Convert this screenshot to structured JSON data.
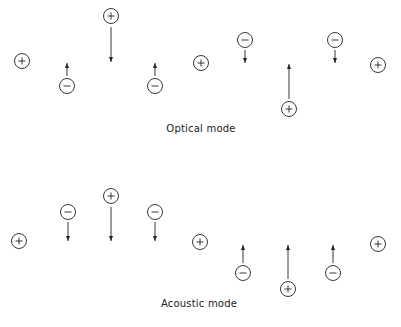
{
  "colors": {
    "ink": "#222222",
    "background": "#ffffff"
  },
  "ion_radius": 7.5,
  "panels": [
    {
      "id": "optical",
      "label": "Optical mode",
      "label_pos": {
        "x": 201,
        "y": 129
      },
      "ions": [
        {
          "charge": "+",
          "x": 22,
          "y": 61
        },
        {
          "charge": "-",
          "x": 67,
          "y": 86,
          "arrow": {
            "dir": "up",
            "from": 76,
            "to": 63
          }
        },
        {
          "charge": "+",
          "x": 111,
          "y": 16,
          "arrow": {
            "dir": "down",
            "from": 27,
            "to": 62
          }
        },
        {
          "charge": "-",
          "x": 155,
          "y": 86,
          "arrow": {
            "dir": "up",
            "from": 76,
            "to": 63
          }
        },
        {
          "charge": "+",
          "x": 201,
          "y": 63
        },
        {
          "charge": "-",
          "x": 245,
          "y": 40,
          "arrow": {
            "dir": "down",
            "from": 50,
            "to": 63
          }
        },
        {
          "charge": "+",
          "x": 289,
          "y": 109,
          "arrow": {
            "dir": "up",
            "from": 99,
            "to": 64
          }
        },
        {
          "charge": "-",
          "x": 335,
          "y": 40,
          "arrow": {
            "dir": "down",
            "from": 50,
            "to": 63
          }
        },
        {
          "charge": "+",
          "x": 378,
          "y": 65
        }
      ]
    },
    {
      "id": "acoustic",
      "label": "Acoustic mode",
      "label_pos": {
        "x": 199,
        "y": 304
      },
      "ions": [
        {
          "charge": "+",
          "x": 19,
          "y": 241
        },
        {
          "charge": "-",
          "x": 68,
          "y": 212,
          "arrow": {
            "dir": "down",
            "from": 222,
            "to": 241
          }
        },
        {
          "charge": "+",
          "x": 111,
          "y": 196,
          "arrow": {
            "dir": "down",
            "from": 207,
            "to": 241
          }
        },
        {
          "charge": "-",
          "x": 155,
          "y": 212,
          "arrow": {
            "dir": "down",
            "from": 222,
            "to": 241
          }
        },
        {
          "charge": "+",
          "x": 200,
          "y": 242
        },
        {
          "charge": "-",
          "x": 243,
          "y": 273,
          "arrow": {
            "dir": "up",
            "from": 263,
            "to": 245
          }
        },
        {
          "charge": "+",
          "x": 288,
          "y": 289,
          "arrow": {
            "dir": "up",
            "from": 279,
            "to": 245
          }
        },
        {
          "charge": "-",
          "x": 333,
          "y": 273,
          "arrow": {
            "dir": "up",
            "from": 263,
            "to": 245
          }
        },
        {
          "charge": "+",
          "x": 378,
          "y": 244
        }
      ]
    }
  ]
}
